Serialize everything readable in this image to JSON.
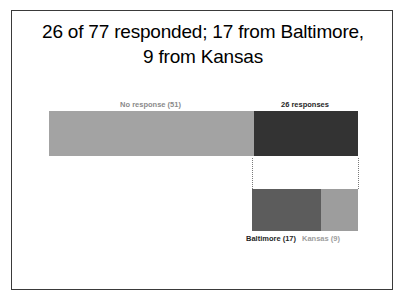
{
  "slide": {
    "title_line1": "26 of 77 responded; 17 from Baltimore,",
    "title_line2": "9 from Kansas"
  },
  "chart_data": {
    "type": "bar",
    "title": "26 of 77 responded; 17 from Baltimore, 9 from Kansas",
    "orientation": "horizontal",
    "stacked": true,
    "grid": false,
    "legend": "inline-labels",
    "xlabel": "",
    "ylabel": "",
    "total": 77,
    "charts": [
      {
        "name": "response-breakdown",
        "categories": [
          "No response",
          "26 responses"
        ],
        "values": [
          51,
          26
        ],
        "total": 77,
        "colors": [
          "#a3a3a3",
          "#333333"
        ],
        "labels": [
          "No response (51)",
          "26 responses"
        ],
        "label_position": "above"
      },
      {
        "name": "responder-origin-breakdown",
        "categories": [
          "Baltimore",
          "Kansas"
        ],
        "values": [
          17,
          9
        ],
        "total": 26,
        "colors": [
          "#5c5c5c",
          "#9d9d9d"
        ],
        "labels": [
          "Baltimore (17)",
          "Kansas (9)"
        ],
        "label_position": "below"
      }
    ]
  },
  "main_bar": {
    "no_response_label": "No response (51)",
    "responses_label": "26 responses",
    "no_response_value": 51,
    "responses_value": 26,
    "no_response_pct": "66.2%",
    "responses_pct": "33.8%"
  },
  "detail_bar": {
    "baltimore_label": "Baltimore (17)",
    "kansas_label": "Kansas (9)",
    "baltimore_value": 17,
    "kansas_value": 9,
    "baltimore_pct": "65.4%",
    "kansas_pct": "34.6%"
  },
  "colors": {
    "no_response": "#a3a3a3",
    "responses": "#333333",
    "baltimore": "#5c5c5c",
    "kansas": "#9d9d9d",
    "frame": "#3a3a3a",
    "background": "#ffffff",
    "title_text": "#000000"
  }
}
